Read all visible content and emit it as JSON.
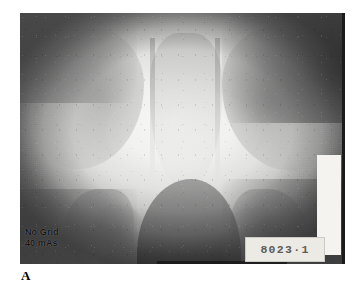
{
  "figure": {
    "part_label": "A",
    "type": "radiograph",
    "modality_note": "pelvic radiograph with circular collimated field"
  },
  "radiograph": {
    "technique_annotation": {
      "line1": "No Grid",
      "line2": "40 mAs"
    },
    "id_label": "8023·1",
    "markers": {
      "white-block": "white-calibration-block",
      "right-border": "dark-film-edge"
    }
  },
  "colors": {
    "film_mid": "#9fa0a0",
    "film_bright": "#f7f7f6",
    "annotation_text": "#121212",
    "id_label_bg": "#eceae4",
    "id_label_text": "#5d5c58",
    "white_block": "#f4f3f0",
    "border_dark": "#1b1b1b",
    "page_bg": "#ffffff"
  }
}
